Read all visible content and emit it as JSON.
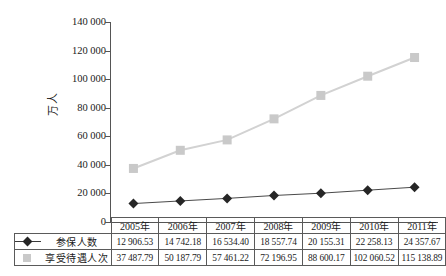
{
  "chart_data": {
    "type": "line",
    "title": "",
    "xlabel": "",
    "ylabel": "万人",
    "ylim": [
      0,
      140000
    ],
    "ytick_labels": [
      "140 000",
      "120 000",
      "100 000",
      "80 000",
      "60 000",
      "40 000",
      "20 000",
      "0"
    ],
    "ytick_values": [
      140000,
      120000,
      100000,
      80000,
      60000,
      40000,
      20000,
      0
    ],
    "grid": false,
    "legend_position": "table-left",
    "categories": [
      "2005年",
      "2006年",
      "2007年",
      "2008年",
      "2009年",
      "2010年",
      "2011年"
    ],
    "series": [
      {
        "name": "参保人数",
        "marker": "diamond",
        "color": "#262626",
        "line_color": "#4a4a4a",
        "values": [
          12906.53,
          14742.18,
          16534.4,
          18557.74,
          20155.31,
          22258.13,
          24357.67
        ],
        "value_labels": [
          "12 906.53",
          "14 742.18",
          "16 534.40",
          "18 557.74",
          "20 155.31",
          "22 258.13",
          "24 357.67"
        ]
      },
      {
        "name": "享受待遇人次",
        "marker": "square",
        "color": "#c9c9c9",
        "line_color": "#d2d2d2",
        "values": [
          37487.79,
          50187.79,
          57461.22,
          72196.95,
          88600.17,
          102060.52,
          115138.89
        ],
        "value_labels": [
          "37 487.79",
          "50 187.79",
          "57 461.22",
          "72 196.95",
          "88 600.17",
          "102 060.52",
          "115 138.89"
        ]
      }
    ]
  },
  "table": {
    "corner_label": "",
    "header": [
      "2005年",
      "2006年",
      "2007年",
      "2008年",
      "2009年",
      "2010年",
      "2011年"
    ],
    "rows": [
      {
        "label": "参保人数",
        "marker": "diamond-marker",
        "cells": [
          "12 906.53",
          "14 742.18",
          "16 534.40",
          "18 557.74",
          "20 155.31",
          "22 258.13",
          "24 357.67"
        ]
      },
      {
        "label": "享受待遇人次",
        "marker": "square-marker",
        "cells": [
          "37 487.79",
          "50 187.79",
          "57 461.22",
          "72 196.95",
          "88 600.17",
          "102 060.52",
          "115 138.89"
        ]
      }
    ]
  },
  "axis": {
    "y_title": "万人",
    "zero_label": "0"
  }
}
